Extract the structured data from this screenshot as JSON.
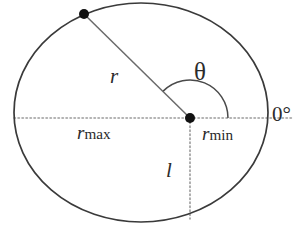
{
  "figure": {
    "kind": "geometry-diagram",
    "background_color": "#ffffff",
    "stroke_color": "#3a3a3a",
    "dotted_color": "#9a9a9a",
    "text_color": "#2b2b2b",
    "canvas": {
      "width": 298,
      "height": 234
    }
  },
  "shapes": {
    "ellipse": {
      "cx": 141,
      "cy": 112.5,
      "rx": 127,
      "ry": 109.5
    },
    "origin_dot": {
      "cx": 190,
      "cy": 118,
      "r": 5
    },
    "boundary_dot": {
      "cx": 84,
      "cy": 14,
      "r": 5
    },
    "radius_line": {
      "x1": 190,
      "y1": 118,
      "x2": 84,
      "y2": 14
    },
    "angle_arc": {
      "cx": 190,
      "cy": 118,
      "radius": 38,
      "start_deg": 0,
      "end_deg": 135
    },
    "horizontal_axis": {
      "x1": 14,
      "y1": 118,
      "x2": 292,
      "y2": 118
    },
    "vertical_drop": {
      "x1": 190,
      "y1": 118,
      "x2": 190,
      "y2": 219
    }
  },
  "labels": {
    "radius": {
      "symbol": "r",
      "name": "radius-label"
    },
    "angle": {
      "symbol": "θ",
      "name": "theta-label"
    },
    "r_max": {
      "symbol": "r",
      "subscript": "max",
      "name": "r-max-label"
    },
    "r_min": {
      "symbol": "r",
      "subscript": "min",
      "name": "r-min-label"
    },
    "chord_l": {
      "symbol": "l",
      "name": "l-label"
    },
    "zero_degree": {
      "symbol": "0°",
      "name": "zero-degree-label"
    }
  }
}
